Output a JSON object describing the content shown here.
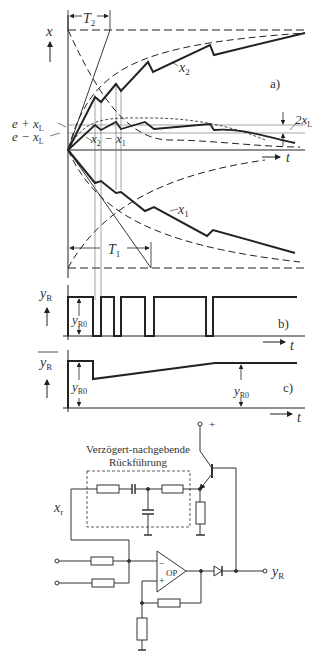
{
  "panel_a": {
    "y_axis_label": "x",
    "t_axis_label": "t",
    "panel_label": "a)",
    "T2_label": "T",
    "T2_sub": "2",
    "T1_label": "T",
    "T1_sub": "1",
    "x2_label": "x",
    "x2_sub": "2",
    "x1_label": "x",
    "x1_sub": "1",
    "e_plus_label": "e + x",
    "e_plus_sub": "L",
    "e_minus_label": "e − x",
    "e_minus_sub": "L",
    "diff_label_a": "x",
    "diff_label_a_sub": "2",
    "diff_label_b": " − x",
    "diff_label_b_sub": "1",
    "band_label": "2x",
    "band_label_sub": "L"
  },
  "panel_b": {
    "y_axis_label": "y",
    "y_axis_sub": "R",
    "amp_label": "y",
    "amp_sub": "R0",
    "t_axis_label": "t",
    "panel_label": "b)"
  },
  "panel_c": {
    "y_axis_label": "y",
    "y_axis_sub": "R",
    "amp_label": "y",
    "amp_sub": "R0",
    "amp_label2": "y",
    "amp_sub2": "R0",
    "t_axis_label": "t",
    "panel_label": "c)"
  },
  "circuit": {
    "feedback_title_line1": "Verzögert-nachgebende",
    "feedback_title_line2": "Rückführung",
    "input_label": "x",
    "input_sub": "r",
    "opamp_label": "OP",
    "output_label": "y",
    "output_sub": "R",
    "supply_label": "+",
    "minus_sign": "−",
    "plus_sign": "+"
  }
}
